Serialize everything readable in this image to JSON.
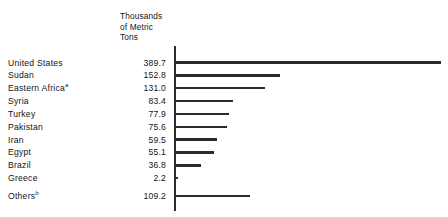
{
  "header": {
    "units_line1": "Thousands",
    "units_line2": "of Metric",
    "units_line3": "Tons"
  },
  "axis": {
    "baseline_color": "#2b2b2b"
  },
  "bar_color": "#2b2b2b",
  "footnote_markers": {
    "eastern_africa": "a",
    "others": "b"
  },
  "chart_data": {
    "type": "bar",
    "orientation": "horizontal",
    "title": "",
    "subtitle": "",
    "xlabel": "Thousands of Metric Tons",
    "ylabel": "",
    "grid": false,
    "legend": "none",
    "xlim": [
      0,
      389.7
    ],
    "categories": [
      "United States",
      "Sudan",
      "Eastern Africa",
      "Syria",
      "Turkey",
      "Pakistan",
      "Iran",
      "Egypt",
      "Brazil",
      "Greece",
      "Others"
    ],
    "values": [
      389.7,
      152.8,
      131.0,
      83.4,
      77.9,
      75.6,
      59.5,
      55.1,
      36.8,
      2.2,
      109.2
    ],
    "value_labels": [
      "389.7",
      "152.8",
      "131.0",
      "83.4",
      "77.9",
      "75.6",
      "59.5",
      "55.1",
      "36.8",
      "2.2",
      "109.2"
    ],
    "category_notes": {
      "Eastern Africa": "a",
      "Others": "b"
    }
  },
  "rows": [
    {
      "label": "United States",
      "sup": "",
      "value": "389.7",
      "bar_px": 265.0,
      "gap": false
    },
    {
      "label": "Sudan",
      "sup": "",
      "value": "152.8",
      "bar_px": 103.9,
      "gap": false
    },
    {
      "label": "Eastern Africa",
      "sup": "a",
      "value": "131.0",
      "bar_px": 89.1,
      "gap": false
    },
    {
      "label": "Syria",
      "sup": "",
      "value": "83.4",
      "bar_px": 56.7,
      "gap": false
    },
    {
      "label": "Turkey",
      "sup": "",
      "value": "77.9",
      "bar_px": 53.0,
      "gap": false
    },
    {
      "label": "Pakistan",
      "sup": "",
      "value": "75.6",
      "bar_px": 51.4,
      "gap": false
    },
    {
      "label": "Iran",
      "sup": "",
      "value": "59.5",
      "bar_px": 40.5,
      "gap": false
    },
    {
      "label": "Egypt",
      "sup": "",
      "value": "55.1",
      "bar_px": 37.5,
      "gap": false
    },
    {
      "label": "Brazil",
      "sup": "",
      "value": "36.8",
      "bar_px": 25.0,
      "gap": false
    },
    {
      "label": "Greece",
      "sup": "",
      "value": "2.2",
      "bar_px": 1.5,
      "gap": false
    },
    {
      "label": "Others",
      "sup": "b",
      "value": "109.2",
      "bar_px": 74.3,
      "gap": true
    }
  ]
}
